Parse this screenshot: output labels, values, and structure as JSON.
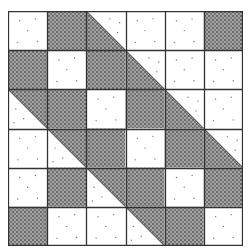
{
  "grid": {
    "rows": 6,
    "cols": 6
  },
  "colors": {
    "light": "#ffffff",
    "dark": "#4a4a4a",
    "line": "#333333"
  },
  "legend": {
    "L": "plain light square",
    "D": "stippled dark square",
    "LD": "half-square triangle: light upper-right, dark lower-left",
    "DL": "half-square triangle: dark upper-right, light lower-left"
  },
  "cells": [
    [
      "L",
      "D",
      "LD",
      "L",
      "L",
      "D"
    ],
    [
      "D",
      "L",
      "D",
      "LD",
      "L",
      "L"
    ],
    [
      "DL",
      "D",
      "L",
      "D",
      "LD",
      "L"
    ],
    [
      "L",
      "DL",
      "D",
      "L",
      "D",
      "LD"
    ],
    [
      "L",
      "D",
      "DL",
      "D",
      "L",
      "D"
    ],
    [
      "D",
      "L",
      "L",
      "DL",
      "D",
      "L"
    ]
  ]
}
